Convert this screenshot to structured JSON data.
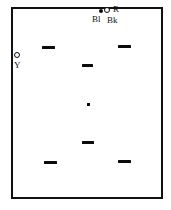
{
  "diagram": {
    "background_color": "#ffffff",
    "ink_color": "#0b0b0b",
    "frame": {
      "name": "enclosure-rectangle",
      "x": 11,
      "y": 7,
      "width": 152,
      "height": 192,
      "border_width": 2,
      "border_color": "#111111"
    },
    "labels": [
      {
        "id": "r",
        "text": "R",
        "x": 113,
        "y": 5,
        "size": "md"
      },
      {
        "id": "bl",
        "text": "Bl",
        "x": 92,
        "y": 15,
        "size": "md"
      },
      {
        "id": "bk",
        "text": "Bk",
        "x": 107,
        "y": 16,
        "size": "md"
      },
      {
        "id": "y",
        "text": "Y",
        "x": 14,
        "y": 61,
        "size": "md"
      }
    ],
    "markers": [
      {
        "id": "marker-bl",
        "kind": "dot",
        "x": 99,
        "y": 9,
        "size": 4
      },
      {
        "id": "marker-bk",
        "kind": "ring",
        "x": 104,
        "y": 7,
        "size": 6
      },
      {
        "id": "marker-y",
        "kind": "ring",
        "x": 14,
        "y": 52,
        "size": 6
      }
    ],
    "dashes": [
      {
        "id": "dash-top-left",
        "x": 42,
        "y": 46,
        "width": 13,
        "height": 3
      },
      {
        "id": "dash-top-right",
        "x": 118,
        "y": 45,
        "width": 13,
        "height": 3
      },
      {
        "id": "dash-upper-center",
        "x": 82,
        "y": 64,
        "width": 11,
        "height": 3
      },
      {
        "id": "dash-lower-center",
        "x": 82,
        "y": 141,
        "width": 12,
        "height": 3
      },
      {
        "id": "dash-bottom-left",
        "x": 44,
        "y": 161,
        "width": 13,
        "height": 3
      },
      {
        "id": "dash-bottom-right",
        "x": 118,
        "y": 160,
        "width": 13,
        "height": 3
      }
    ],
    "nodes": [
      {
        "id": "node-center",
        "x": 87,
        "y": 103,
        "width": 3,
        "height": 3
      }
    ]
  }
}
